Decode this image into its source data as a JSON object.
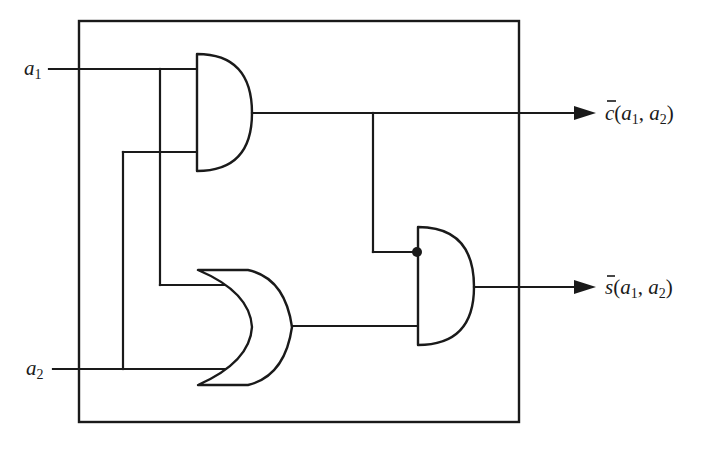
{
  "diagram": {
    "type": "logic-circuit",
    "colors": {
      "ink": "#1a1a1a",
      "background": "#ffffff"
    },
    "inputs": [
      {
        "id": "a1",
        "base": "a",
        "sub": "1"
      },
      {
        "id": "a2",
        "base": "a",
        "sub": "2"
      }
    ],
    "outputs": [
      {
        "id": "c",
        "base": "c",
        "bar": "̄",
        "open": "(",
        "arg1": "a",
        "arg1_sub": "1",
        "sep": ", ",
        "arg2": "a",
        "arg2_sub": "2",
        "close": ")"
      },
      {
        "id": "s",
        "base": "s",
        "bar": "̄",
        "open": "(",
        "arg1": "a",
        "arg1_sub": "1",
        "sep": ", ",
        "arg2": "a",
        "arg2_sub": "2",
        "close": ")"
      }
    ],
    "gates": [
      {
        "id": "and1",
        "kind": "AND",
        "inputs": [
          "a1",
          "a2"
        ],
        "output": "c"
      },
      {
        "id": "or1",
        "kind": "OR",
        "inputs": [
          "a1",
          "a2"
        ],
        "output": "or_out"
      },
      {
        "id": "and2",
        "kind": "AND",
        "inputs": [
          "NOT c (inverting dot)",
          "or_out"
        ],
        "output": "s"
      }
    ]
  }
}
